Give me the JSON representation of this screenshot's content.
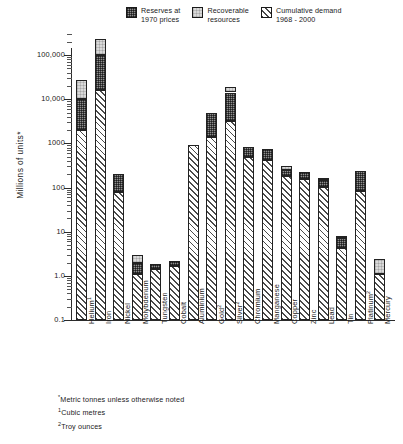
{
  "legend": {
    "items": [
      {
        "label": "Reserves at\n1970 prices",
        "pattern": "pat-reserves",
        "icon": "legend-swatch-reserves"
      },
      {
        "label": "Recoverable\nresources",
        "pattern": "pat-recoverable",
        "icon": "legend-swatch-recoverable"
      },
      {
        "label": "Cumulative demand\n1968 - 2000",
        "pattern": "pat-demand",
        "icon": "legend-swatch-demand"
      }
    ]
  },
  "footnotes": [
    "*Metric tonnes unless otherwise noted",
    "1Cubic metres",
    "2Troy ounces"
  ],
  "chart_data": {
    "type": "bar",
    "stacked": true,
    "title": "",
    "xlabel": "",
    "ylabel": "Millions of units*",
    "yscale": "log",
    "ylim": [
      0.1,
      300000
    ],
    "grid": false,
    "legend_position": "top-right",
    "ytick_labels": [
      "100,000",
      "10,000",
      "1000",
      "100",
      "10",
      "1.0",
      "0.1"
    ],
    "ytick_values": [
      100000,
      10000,
      1000,
      100,
      10,
      1.0,
      0.1
    ],
    "categories": [
      "Helium1",
      "Iron",
      "Nickel",
      "Molybdenum",
      "Tungsten",
      "Cobalt",
      "Aluminium",
      "Gold2",
      "Silver2",
      "Chromium",
      "Manganese",
      "Copper",
      "Zinc",
      "Lead",
      "Tin",
      "Platinum2",
      "Mercury"
    ],
    "category_labels": [
      {
        "text": "Helium",
        "sup": "1"
      },
      {
        "text": "Iron",
        "sup": ""
      },
      {
        "text": "Nickel",
        "sup": ""
      },
      {
        "text": "Molybdenum",
        "sup": ""
      },
      {
        "text": "Tungsten",
        "sup": ""
      },
      {
        "text": "Cobalt",
        "sup": ""
      },
      {
        "text": "Aluminium",
        "sup": ""
      },
      {
        "text": "Gold",
        "sup": "2"
      },
      {
        "text": "Silver",
        "sup": "2"
      },
      {
        "text": "Chromium",
        "sup": ""
      },
      {
        "text": "Manganese",
        "sup": ""
      },
      {
        "text": "Copper",
        "sup": ""
      },
      {
        "text": "Zinc",
        "sup": ""
      },
      {
        "text": "Lead",
        "sup": ""
      },
      {
        "text": "Tin",
        "sup": ""
      },
      {
        "text": "Platinum",
        "sup": "2"
      },
      {
        "text": "Mercury",
        "sup": ""
      }
    ],
    "series": [
      {
        "name": "Cumulative demand 1968 - 2000",
        "pattern": "pat-demand",
        "values": [
          2000,
          16000,
          80,
          1.0,
          1.3,
          1.6,
          900,
          1400,
          3200,
          500,
          420,
          180,
          155,
          105,
          4.2,
          85,
          1.0
        ]
      },
      {
        "name": "Reserves at 1970 prices",
        "pattern": "pat-reserves",
        "values": [
          8000,
          84000,
          120,
          0.85,
          0.45,
          0.5,
          0,
          3600,
          11000,
          350,
          330,
          70,
          75,
          40,
          3.0,
          150,
          0
        ]
      },
      {
        "name": "Recoverable resources",
        "pattern": "pat-recoverable",
        "values": [
          18000,
          130000,
          0,
          1.1,
          0,
          0,
          0,
          0,
          5000,
          0,
          0,
          60,
          0,
          20,
          0.6,
          0,
          1.3
        ]
      }
    ],
    "totals": [
      28000,
      230000,
      200,
      2.95,
      1.75,
      2.1,
      900,
      5000,
      19200,
      850,
      750,
      310,
      230,
      165,
      7.8,
      235,
      2.3
    ]
  }
}
